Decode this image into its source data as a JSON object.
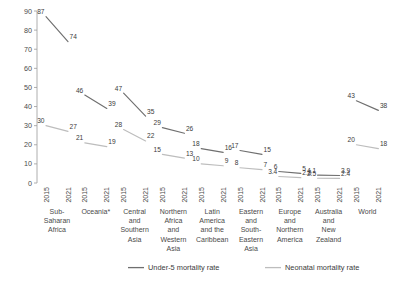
{
  "chart_data": {
    "type": "line",
    "title": "",
    "subtitle": "",
    "xlabel": "",
    "ylabel": "",
    "ylim": [
      0,
      90
    ],
    "ytick_step": 10,
    "yticks": [
      "0",
      "10",
      "20",
      "30",
      "40",
      "50",
      "60",
      "70",
      "80",
      "90"
    ],
    "grid": false,
    "legend_position": "bottom",
    "x": [
      "2015",
      "2021"
    ],
    "categories": [
      "Sub-Saharan Africa",
      "Oceania*",
      "Central and Southern Asia",
      "Northern Africa and Western Asia",
      "Latin America and the Caribbean",
      "Eastern and South-Eastern Asia",
      "Europe and Northern America",
      "Australia and New Zealand",
      "World"
    ],
    "category_lines": [
      [
        "Sub-",
        "Saharan",
        "Africa"
      ],
      [
        "Oceania*"
      ],
      [
        "Central",
        "and",
        "Southern",
        "Asia"
      ],
      [
        "Northern",
        "Africa",
        "and",
        "Western",
        "Asia"
      ],
      [
        "Latin",
        "America",
        "and the",
        "Caribbean"
      ],
      [
        "Eastern",
        "and",
        "South-",
        "Eastern",
        "Asia"
      ],
      [
        "Europe",
        "and",
        "Northern",
        "America"
      ],
      [
        "Australia",
        "and",
        "New",
        "Zealand"
      ],
      [
        "World"
      ]
    ],
    "series": [
      {
        "name": "Under-5 mortality rate",
        "color": "#6f6f6f",
        "values": [
          [
            87,
            74
          ],
          [
            46,
            39
          ],
          [
            47,
            35
          ],
          [
            29,
            26
          ],
          [
            18,
            16
          ],
          [
            17,
            15
          ],
          [
            6,
            5
          ],
          [
            4.1,
            3.9
          ],
          [
            43,
            38
          ]
        ],
        "labels": [
          [
            "87",
            "74"
          ],
          [
            "46",
            "39"
          ],
          [
            "47",
            "35"
          ],
          [
            "29",
            "26"
          ],
          [
            "18",
            "16"
          ],
          [
            "17",
            "15"
          ],
          [
            "6",
            "5"
          ],
          [
            "4.1",
            "3.9"
          ],
          [
            "43",
            "38"
          ]
        ]
      },
      {
        "name": "Neonatal mortality rate",
        "color": "#bdbdbd",
        "values": [
          [
            30,
            27
          ],
          [
            21,
            19
          ],
          [
            28,
            22
          ],
          [
            15,
            13
          ],
          [
            10,
            9
          ],
          [
            8,
            7
          ],
          [
            3.4,
            2.8
          ],
          [
            2.5,
            2.4
          ],
          [
            20,
            18
          ]
        ],
        "labels": [
          [
            "30",
            "27"
          ],
          [
            "21",
            "19"
          ],
          [
            "28",
            "22"
          ],
          [
            "15",
            "13"
          ],
          [
            "10",
            "9"
          ],
          [
            "8",
            "7"
          ],
          [
            "3.4",
            "2.8"
          ],
          [
            "2.5",
            "2.4"
          ],
          [
            "20",
            "18"
          ]
        ]
      }
    ]
  },
  "legend": {
    "items": [
      {
        "label": "Under-5 mortality rate",
        "color": "#6f6f6f"
      },
      {
        "label": "Neonatal mortality rate",
        "color": "#bdbdbd"
      }
    ]
  }
}
